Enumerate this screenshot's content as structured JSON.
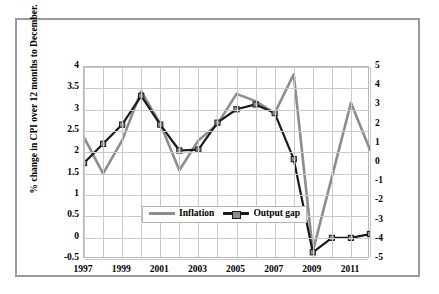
{
  "chart_data": {
    "type": "line",
    "title": "",
    "xlabel": "",
    "x": [
      1997,
      1998,
      1999,
      2000,
      2001,
      2002,
      2003,
      2004,
      2005,
      2006,
      2007,
      2008,
      2009,
      2010,
      2011,
      2012
    ],
    "xticklabels": [
      "1997",
      "1999",
      "2001",
      "2003",
      "2005",
      "2007",
      "2009",
      "2011"
    ],
    "xtickvalues": [
      1997,
      1999,
      2001,
      2003,
      2005,
      2007,
      2009,
      2011
    ],
    "xlim": [
      1997,
      2012
    ],
    "grid": true,
    "legend_position": "center-lower",
    "left_axis": {
      "label": "% change in CPI over 12 months to December.",
      "ticks": [
        4,
        3.5,
        3,
        2.5,
        2,
        1.5,
        1,
        0.5,
        0,
        -0.5
      ],
      "ticklabels": [
        "4",
        "3.5",
        "3",
        "2.5",
        "2",
        "1.5",
        "1",
        "0.5",
        "0",
        "-0.5"
      ],
      "lim": [
        -0.5,
        4
      ]
    },
    "right_axis": {
      "label": "Difference between actual and potential GDP in percentage points.",
      "ticks": [
        5,
        4,
        3,
        2,
        1,
        0,
        -1,
        -2,
        -3,
        -4,
        -5
      ],
      "ticklabels": [
        "5",
        "4",
        "3",
        "2",
        "1",
        "0",
        "-1",
        "-2",
        "-3",
        "-4",
        "-5"
      ],
      "lim": [
        -5,
        5
      ]
    },
    "series": [
      {
        "name": "Inflation",
        "axis": "left",
        "color": "#8d8d8d",
        "marker": "none",
        "values": [
          2.35,
          1.5,
          2.28,
          3.43,
          2.67,
          1.58,
          2.28,
          2.66,
          3.37,
          3.2,
          2.92,
          3.83,
          -0.32,
          1.42,
          3.16,
          2.06
        ]
      },
      {
        "name": "Output gap",
        "axis": "right",
        "color": "#1a1a1a",
        "marker": "square",
        "values": [
          0.0,
          1.0,
          2.0,
          3.5,
          2.0,
          0.65,
          0.7,
          2.1,
          2.8,
          3.05,
          2.6,
          0.2,
          -4.65,
          -3.9,
          -3.9,
          -3.7
        ]
      }
    ]
  },
  "legend": {
    "items": [
      {
        "label": "Inflation"
      },
      {
        "label": "Output gap"
      }
    ]
  }
}
